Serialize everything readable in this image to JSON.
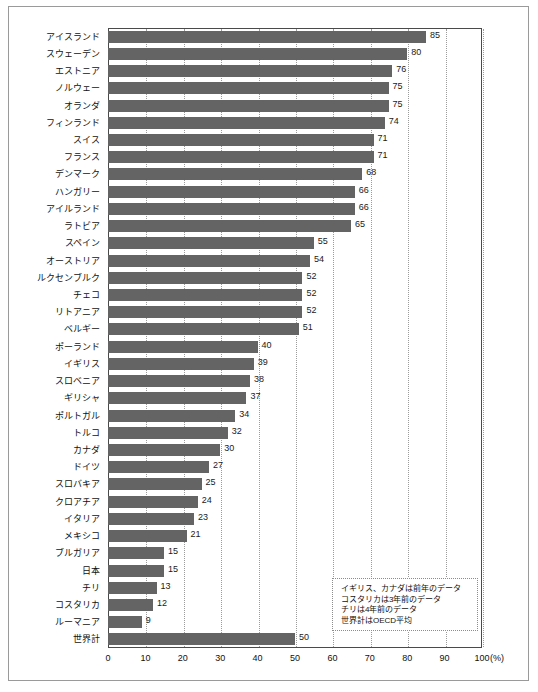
{
  "chart_data": {
    "type": "bar",
    "orientation": "horizontal",
    "title": "",
    "xlabel": "(%)",
    "ylabel": "",
    "xlim": [
      0,
      100
    ],
    "xticks": [
      "0",
      "10",
      "20",
      "30",
      "40",
      "50",
      "60",
      "70",
      "80",
      "90",
      "100"
    ],
    "x_unit_label": "(%)",
    "grid": "vertical-dotted",
    "legend": "none",
    "bar_color": "#646464",
    "categories": [
      "アイスランド",
      "スウェーデン",
      "エストニア",
      "ノルウェー",
      "オランダ",
      "フィンランド",
      "スイス",
      "フランス",
      "デンマーク",
      "ハンガリー",
      "アイルランド",
      "ラトビア",
      "スペイン",
      "オーストリア",
      "ルクセンブルク",
      "チェコ",
      "リトアニア",
      "ベルギー",
      "ポーランド",
      "イギリス",
      "スロベニア",
      "ギリシャ",
      "ポルトガル",
      "トルコ",
      "カナダ",
      "ドイツ",
      "スロバキア",
      "クロアチア",
      "イタリア",
      "メキシコ",
      "ブルガリア",
      "日本",
      "チリ",
      "コスタリカ",
      "ルーマニア",
      "世界計"
    ],
    "values": [
      85,
      80,
      76,
      75,
      75,
      74,
      71,
      71,
      68,
      66,
      66,
      65,
      55,
      54,
      52,
      52,
      52,
      51,
      40,
      39,
      38,
      37,
      34,
      32,
      30,
      27,
      25,
      24,
      23,
      21,
      15,
      15,
      13,
      12,
      9,
      50
    ],
    "annotations": [
      "イギリス、カナダは前年のデータ",
      "コスタリカは3年前のデータ",
      "チリは4年前のデータ",
      "世界計はOECD平均"
    ]
  }
}
